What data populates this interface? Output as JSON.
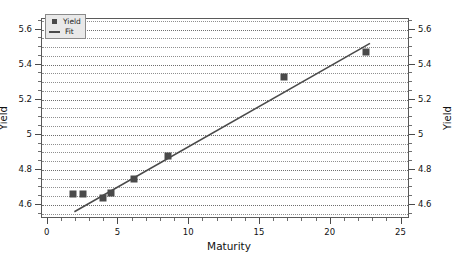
{
  "chart_data": {
    "type": "scatter",
    "title": "",
    "xlabel": "Maturity",
    "ylabel": "Yield",
    "ylabel_right": "Yield",
    "xlim": [
      -0.4,
      25.6
    ],
    "ylim": [
      4.52,
      5.66
    ],
    "xticks": [
      0,
      5,
      10,
      15,
      20,
      25
    ],
    "xticklabels": [
      "0",
      "5",
      "10",
      "15",
      "20",
      "25"
    ],
    "yticks": [
      4.6,
      4.8,
      5.0,
      5.2,
      5.4,
      5.6
    ],
    "yticklabels": [
      "4.6",
      "4.8",
      "5",
      "5.2",
      "5.4",
      "5.6"
    ],
    "yticklabels_right": [
      "4.6",
      "4.8",
      "5",
      "5.2",
      "5.4",
      "5.6"
    ],
    "grid": true,
    "grid_style": "dotted-horizontal",
    "grid_minor_step": 0.05,
    "legend_position": "upper-left",
    "marker_color": "#4a4a4a",
    "line_color": "#4a4a4a",
    "frame_color": "#5a5a5a",
    "background": "#ffffff",
    "series": [
      {
        "name": "Yield",
        "type": "scatter",
        "marker": "square",
        "x": [
          1.8,
          2.5,
          3.9,
          4.5,
          6.1,
          8.5,
          16.7,
          22.5
        ],
        "y": [
          4.66,
          4.66,
          4.64,
          4.67,
          4.75,
          4.88,
          5.33,
          5.47
        ]
      },
      {
        "name": "Fit",
        "type": "line",
        "x": [
          1.9,
          22.9
        ],
        "y": [
          4.55,
          5.52
        ]
      }
    ],
    "legend": [
      {
        "label": "Yield",
        "swatch": "marker"
      },
      {
        "label": "Fit",
        "swatch": "line"
      }
    ]
  }
}
